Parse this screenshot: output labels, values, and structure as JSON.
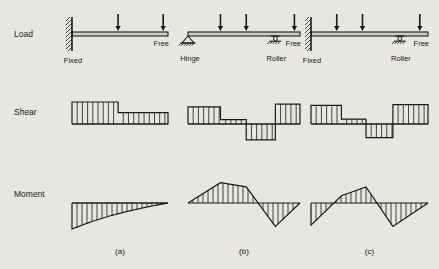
{
  "figure": {
    "background": "#e8e6e1",
    "ink": "#1a1a1a",
    "rows": [
      {
        "key": "load",
        "label": "Load"
      },
      {
        "key": "shear",
        "label": "Shear"
      },
      {
        "key": "moment",
        "label": "Moment"
      }
    ],
    "captions": [
      {
        "key": "a",
        "label": "(a)"
      },
      {
        "key": "b",
        "label": "(b)"
      },
      {
        "key": "c",
        "label": "(c)"
      }
    ]
  },
  "columns": [
    {
      "key": "a",
      "caption": "(a)",
      "beam": {
        "supports": [
          {
            "type": "fixed",
            "label": "Fixed",
            "pos": 0.0
          },
          {
            "type": "free",
            "label": "Free",
            "pos": 1.0
          }
        ],
        "loads": [
          {
            "type": "point-down",
            "pos": 0.48
          },
          {
            "type": "point-down",
            "pos": 0.95
          }
        ]
      },
      "shear": {
        "type": "step",
        "description": "two positive steps, high at fixed end dropping to lower level",
        "steps": [
          {
            "from": 0.0,
            "to": 0.48,
            "value": 1.0
          },
          {
            "from": 0.48,
            "to": 1.0,
            "value": 0.52
          }
        ]
      },
      "moment": {
        "type": "curve",
        "description": "negative curved wedge, maximum magnitude at fixed end tapering to zero at free end",
        "points": [
          {
            "x": 0.0,
            "y": -1.0
          },
          {
            "x": 0.2,
            "y": -0.72
          },
          {
            "x": 0.4,
            "y": -0.49
          },
          {
            "x": 0.6,
            "y": -0.3
          },
          {
            "x": 0.8,
            "y": -0.14
          },
          {
            "x": 1.0,
            "y": 0.0
          }
        ]
      }
    },
    {
      "key": "b",
      "caption": "(b)",
      "beam": {
        "supports": [
          {
            "type": "hinge",
            "label": "Hinge",
            "pos": 0.0
          },
          {
            "type": "roller",
            "label": "Roller",
            "pos": 0.78
          },
          {
            "type": "free",
            "label": "Free",
            "pos": 1.0
          }
        ],
        "loads": [
          {
            "type": "point-down",
            "pos": 0.29
          },
          {
            "type": "point-down",
            "pos": 0.52
          },
          {
            "type": "point-down",
            "pos": 0.95
          }
        ]
      },
      "shear": {
        "type": "step",
        "description": "positive block, small positive block, negative block, positive block",
        "steps": [
          {
            "from": 0.0,
            "to": 0.29,
            "value": 0.78
          },
          {
            "from": 0.29,
            "to": 0.52,
            "value": 0.2
          },
          {
            "from": 0.52,
            "to": 0.78,
            "value": -0.72
          },
          {
            "from": 0.78,
            "to": 1.0,
            "value": 0.9
          }
        ]
      },
      "moment": {
        "type": "polyline",
        "description": "positive triangular hump peaking left of centre, crossing zero then negative triangle",
        "points": [
          {
            "x": 0.0,
            "y": 0.0
          },
          {
            "x": 0.29,
            "y": 0.78
          },
          {
            "x": 0.52,
            "y": 0.62
          },
          {
            "x": 0.78,
            "y": -0.9
          },
          {
            "x": 1.0,
            "y": 0.0
          }
        ]
      }
    },
    {
      "key": "c",
      "caption": "(c)",
      "beam": {
        "supports": [
          {
            "type": "fixed",
            "label": "Fixed",
            "pos": 0.0
          },
          {
            "type": "roller",
            "label": "Roller",
            "pos": 0.76
          },
          {
            "type": "free",
            "label": "Free",
            "pos": 1.0
          }
        ],
        "loads": [
          {
            "type": "point-down",
            "pos": 0.22
          },
          {
            "type": "point-down",
            "pos": 0.44
          },
          {
            "type": "point-down",
            "pos": 0.93
          }
        ]
      },
      "shear": {
        "type": "step",
        "description": "positive block, small positive block, negative block, positive block",
        "steps": [
          {
            "from": 0.0,
            "to": 0.26,
            "value": 0.85
          },
          {
            "from": 0.26,
            "to": 0.47,
            "value": 0.22
          },
          {
            "from": 0.47,
            "to": 0.7,
            "value": -0.62
          },
          {
            "from": 0.7,
            "to": 1.0,
            "value": 0.88
          }
        ]
      },
      "moment": {
        "type": "polyline",
        "description": "negative triangle at fixed end, rising to positive hump, then negative dip, returning to zero at free end",
        "points": [
          {
            "x": 0.0,
            "y": -0.85
          },
          {
            "x": 0.26,
            "y": 0.28
          },
          {
            "x": 0.47,
            "y": 0.62
          },
          {
            "x": 0.7,
            "y": -0.9
          },
          {
            "x": 1.0,
            "y": 0.0
          }
        ]
      }
    }
  ]
}
